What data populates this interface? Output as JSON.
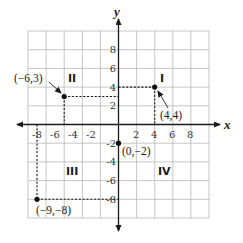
{
  "figure": {
    "x_axis_label": "x",
    "y_axis_label": "y",
    "x_tick_labels": [
      "-8",
      "-6",
      "-4",
      "-2",
      "2",
      "4",
      "6",
      "8"
    ],
    "y_tick_labels": [
      "8",
      "6",
      "4",
      "2",
      "-2",
      "-4",
      "-6",
      "-8"
    ],
    "quadrants": {
      "q1": "I",
      "q2": "II",
      "q3": "III",
      "q4": "IV"
    },
    "points": [
      {
        "label": "(−6,3)",
        "x": -6,
        "y": 3
      },
      {
        "label": "(4,4)",
        "x": 4,
        "y": 4
      },
      {
        "label": "(0,−2)",
        "x": 0,
        "y": -2
      },
      {
        "label": "(−9,−8)",
        "x": -9,
        "y": -8
      }
    ],
    "grid_range": {
      "xmin": -10,
      "xmax": 10,
      "ymin": -10,
      "ymax": 10
    },
    "grid_step": 2,
    "colors": {
      "grid": "#b8b8b8",
      "ink": "#1a1a1a"
    }
  }
}
